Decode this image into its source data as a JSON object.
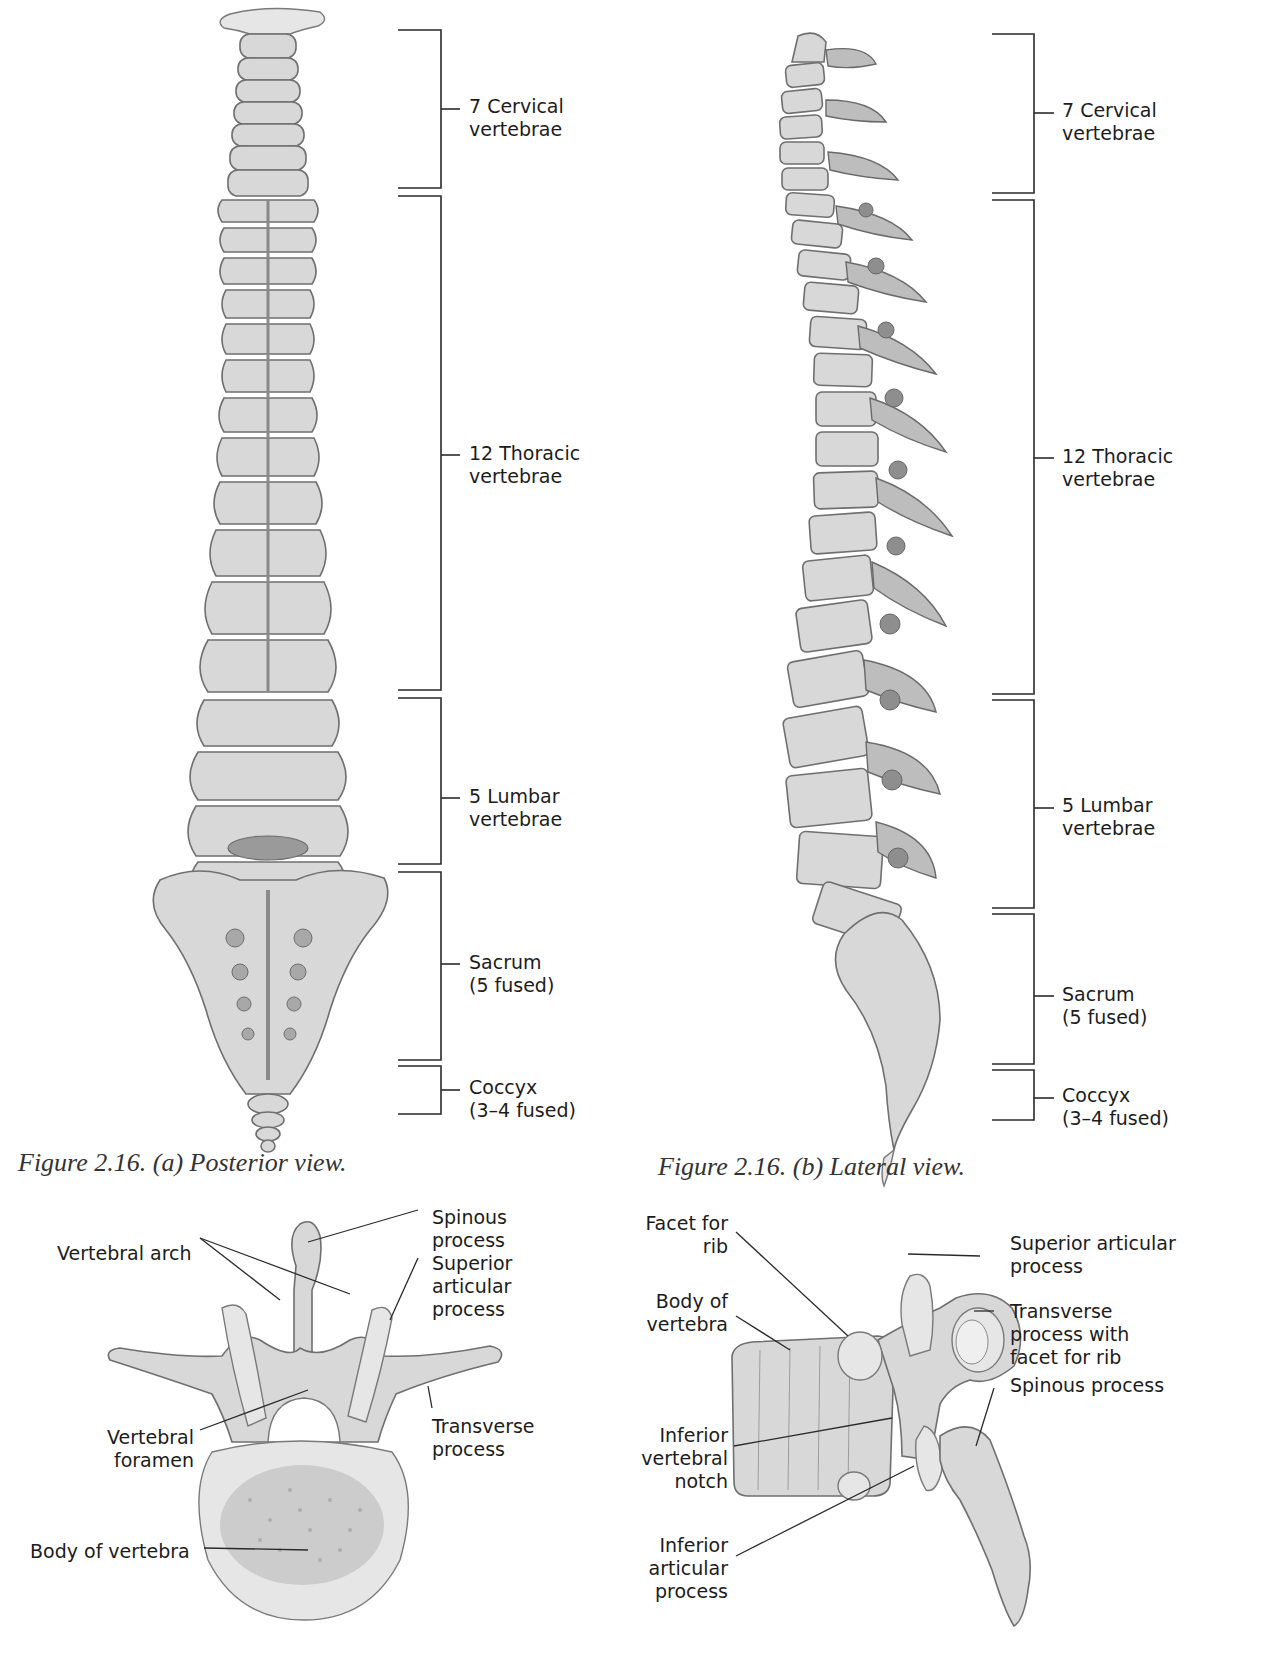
{
  "figure_a": {
    "caption": "Figure 2.16. (a) Posterior view.",
    "regions": [
      {
        "label": "7 Cervical\nvertebrae"
      },
      {
        "label": "12 Thoracic\nvertebrae"
      },
      {
        "label": "5 Lumbar\nvertebrae"
      },
      {
        "label": "Sacrum\n(5 fused)"
      },
      {
        "label": "Coccyx\n(3–4 fused)"
      }
    ]
  },
  "figure_b": {
    "caption": "Figure 2.16. (b) Lateral view.",
    "regions": [
      {
        "label": "7 Cervical\nvertebrae"
      },
      {
        "label": "12 Thoracic\nvertebrae"
      },
      {
        "label": "5 Lumbar\nvertebrae"
      },
      {
        "label": "Sacrum\n(5 fused)"
      },
      {
        "label": "Coccyx\n(3–4 fused)"
      }
    ]
  },
  "vertebra_superior": {
    "labels": {
      "spinous_process": "Spinous\nprocess",
      "vertebral_arch": "Vertebral arch",
      "superior_articular_process": "Superior\narticular\nprocess",
      "transverse_process": "Transverse\nprocess",
      "vertebral_foramen": "Vertebral\nforamen",
      "body_of_vertebra": "Body of vertebra"
    }
  },
  "vertebra_lateral": {
    "labels": {
      "facet_for_rib": "Facet for\nrib",
      "superior_articular_process": "Superior articular\nprocess",
      "body_of_vertebra": "Body of\nvertebra",
      "transverse_process": "Transverse\nprocess with\nfacet for rib",
      "spinous_process": "Spinous process",
      "inferior_vertebral_notch": "Inferior\nvertebral\nnotch",
      "inferior_articular_process": "Inferior\narticular\nprocess"
    }
  }
}
